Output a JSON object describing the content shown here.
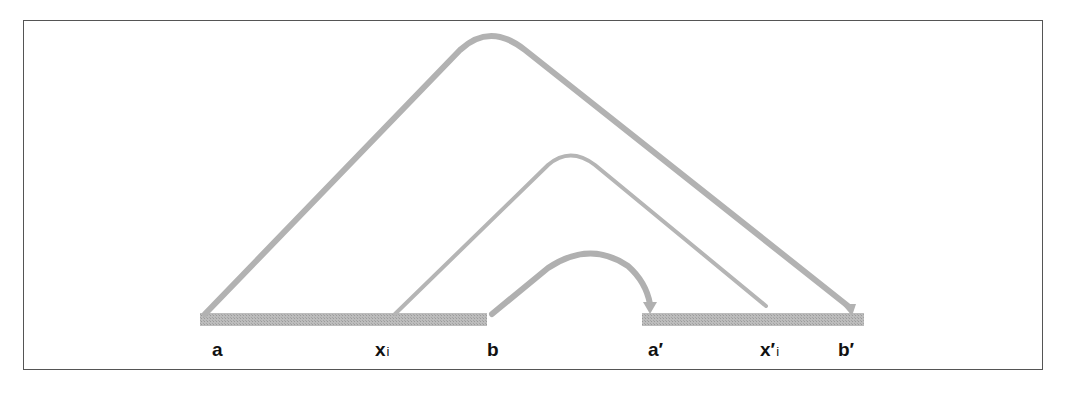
{
  "diagram": {
    "type": "arc-mapping",
    "colors": {
      "arc": "#b0b0b0",
      "segment": "#b5b5b5",
      "frame": "#555555",
      "label": "#111111"
    },
    "segments": [
      {
        "id": "left",
        "from": "a",
        "to": "b"
      },
      {
        "id": "right",
        "from": "a'",
        "to": "b'"
      }
    ],
    "arcs": [
      {
        "from": "a",
        "to": "b'",
        "level": "outer"
      },
      {
        "from": "x_i",
        "to": "x'_i",
        "level": "middle"
      },
      {
        "from": "b",
        "to": "a'",
        "level": "inner"
      }
    ],
    "labels": {
      "a": "a",
      "xi_main": "x",
      "xi_sub": "i",
      "b": "b",
      "a_prime": "a′",
      "xpi_main": "x′",
      "xpi_sub": "i",
      "b_prime": "b′"
    }
  }
}
